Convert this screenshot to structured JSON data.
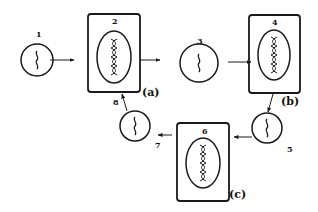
{
  "diagram": {
    "type": "lifecycle-cycle",
    "colors": {
      "stroke": "#1a1a1a",
      "background": "#ffffff"
    },
    "nodes": [
      {
        "id": "1",
        "label": "1",
        "shape": "circle",
        "content": "wavy-strand"
      },
      {
        "id": "2",
        "label": "2",
        "shape": "box-with-oval",
        "content": "double-helix",
        "tag": "(a)"
      },
      {
        "id": "3",
        "label": "3",
        "shape": "circle",
        "content": "wavy-strand"
      },
      {
        "id": "4",
        "label": "4",
        "shape": "box-with-oval",
        "content": "double-helix",
        "tag": "(b)"
      },
      {
        "id": "5",
        "label": "5",
        "shape": "circle",
        "content": "wavy-strand"
      },
      {
        "id": "6",
        "label": "6",
        "shape": "box-with-oval",
        "content": "double-helix",
        "tag": "(c)"
      },
      {
        "id": "7",
        "label": "7",
        "shape": "arrow-label"
      },
      {
        "id": "8",
        "label": "8",
        "shape": "circle-with-arrow-label",
        "content": "wavy-strand"
      }
    ],
    "edges": [
      {
        "from": "1",
        "to": "2"
      },
      {
        "from": "2",
        "to": "3"
      },
      {
        "from": "3",
        "to": "4"
      },
      {
        "from": "4",
        "to": "5"
      },
      {
        "from": "5",
        "to": "6"
      },
      {
        "from": "6",
        "to": "7"
      },
      {
        "from": "7",
        "to": "2"
      }
    ],
    "labels": {
      "n1": "1",
      "n2": "2",
      "n3": "3",
      "n4": "4",
      "n5": "5",
      "n6": "6",
      "n7": "7",
      "n8": "8",
      "tag_a": "(a)",
      "tag_b": "(b)",
      "tag_c": "(c)"
    }
  }
}
